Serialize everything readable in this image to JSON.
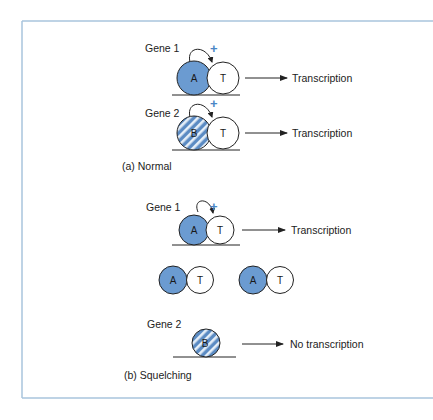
{
  "colors": {
    "frame": "#a9c4dc",
    "activator_fill": "#6b9bd1",
    "stripe_light": "#e6eff8",
    "stripe_dark": "#5b8bc3",
    "plus": "#4a86c5",
    "line": "#222222"
  },
  "panel_a": {
    "caption": "(a) Normal",
    "gene1": {
      "label": "Gene 1",
      "activator": "A",
      "tf": "T",
      "plus": "+",
      "result": "Transcription"
    },
    "gene2": {
      "label": "Gene 2",
      "activator": "B",
      "tf": "T",
      "plus": "+",
      "result": "Transcription"
    }
  },
  "panel_b": {
    "caption": "(b) Squelching",
    "gene1": {
      "label": "Gene 1",
      "activator": "A",
      "tf": "T",
      "plus": "+",
      "result": "Transcription"
    },
    "free_complexes": [
      {
        "activator": "A",
        "tf": "T"
      },
      {
        "activator": "A",
        "tf": "T"
      }
    ],
    "gene2": {
      "label": "Gene 2",
      "activator": "B",
      "result": "No transcription"
    }
  }
}
